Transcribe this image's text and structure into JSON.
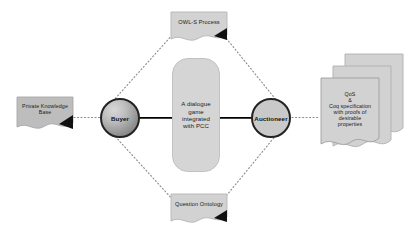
{
  "diagram": {
    "type": "flow-diagram",
    "background_color": "#ffffff",
    "nodes": {
      "buyer": {
        "label": "Buyer",
        "shape": "circle",
        "fill": "#a8a8a8",
        "stroke": "#232323"
      },
      "auctioneer": {
        "label": "Auctioneer",
        "shape": "circle",
        "fill": "#c9c9c9",
        "stroke": "#232323"
      }
    },
    "center_box": {
      "lines": [
        "A dialogue",
        "game",
        "integrated",
        "with PCC"
      ],
      "text": "A dialogue game integrated with PCC",
      "fill": "#d5d5d5"
    },
    "documents": {
      "owl_s_process": {
        "label": "OWL-S Process",
        "fill": "#d2d2d2"
      },
      "question_ontology": {
        "label": "Question Ontology",
        "fill": "#d2d2d2"
      },
      "private_knowledge_base": {
        "lines": [
          "Private Knowledge",
          "Base"
        ],
        "text": "Private Knowledge Base",
        "fill": "#bdbdbd"
      },
      "qos_coq_spec": {
        "lines": [
          "QoS",
          "&",
          "Coq specification",
          "with proofs of",
          "desirable",
          "properties"
        ],
        "text": "QoS & Coq specification with proofs of desirable properties",
        "fill": "#d2d2d2",
        "stack_count": 3
      }
    },
    "connectors": {
      "buyer_auctioneer": {
        "style": "solid",
        "direction": "bidirectional",
        "color": "#000000"
      },
      "kb_to_buyer": {
        "style": "dotted",
        "direction": "none",
        "color": "#8a8a8a"
      },
      "auctioneer_to_qos": {
        "style": "dotted",
        "direction": "none",
        "color": "#8a8a8a"
      },
      "buyer_to_owls": {
        "style": "dotted",
        "direction": "none",
        "color": "#8a8a8a"
      },
      "owls_to_auctioneer": {
        "style": "dotted",
        "direction": "none",
        "color": "#8a8a8a"
      },
      "buyer_to_question": {
        "style": "dotted",
        "direction": "none",
        "color": "#8a8a8a"
      },
      "question_to_auctioneer": {
        "style": "dotted",
        "direction": "none",
        "color": "#8a8a8a"
      }
    }
  }
}
